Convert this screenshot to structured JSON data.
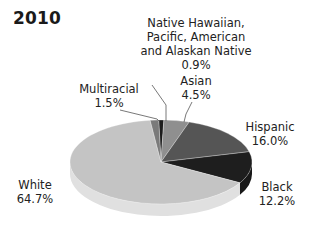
{
  "chart_data": {
    "type": "pie",
    "title": "2010",
    "style": "3d-grayscale",
    "slices": [
      {
        "label": "Native Hawaiian, Pacific, American and Alaskan Native",
        "value": 0.9,
        "display": "0.9%",
        "color": "#1c1c1c"
      },
      {
        "label": "Asian",
        "value": 4.5,
        "display": "4.5%",
        "color": "#8f8f8f"
      },
      {
        "label": "Hispanic",
        "value": 16.0,
        "display": "16.0%",
        "color": "#555555"
      },
      {
        "label": "Black",
        "value": 12.2,
        "display": "12.2%",
        "color": "#1e1e1e"
      },
      {
        "label": "White",
        "value": 64.7,
        "display": "64.7%",
        "color": "#c4c4c4"
      },
      {
        "label": "Multiracial",
        "value": 1.5,
        "display": "1.5%",
        "color": "#7a7a7a"
      }
    ],
    "categories": [
      "Native Hawaiian, Pacific, American and Alaskan Native",
      "Asian",
      "Hispanic",
      "Black",
      "White",
      "Multiracial"
    ],
    "values": [
      0.9,
      4.5,
      16.0,
      12.2,
      64.7,
      1.5
    ],
    "legend": "none (direct labels)"
  },
  "labels": {
    "nhpi_line1": "Native Hawaiian,",
    "nhpi_line2": "Pacific, American",
    "nhpi_line3": "and Alaskan Native",
    "nhpi_value": "0.9%",
    "asian_name": "Asian",
    "asian_value": "4.5%",
    "hispanic_name": "Hispanic",
    "hispanic_value": "16.0%",
    "black_name": "Black",
    "black_value": "12.2%",
    "white_name": "White",
    "white_value": "64.7%",
    "multi_name": "Multiracial",
    "multi_value": "1.5%"
  }
}
